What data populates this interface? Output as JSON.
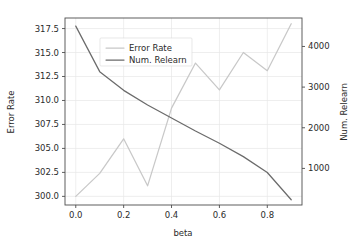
{
  "chart_data": {
    "type": "line",
    "title": "",
    "xlabel": "beta",
    "ylabel": "Error Rate",
    "y2label": "Num. Relearn",
    "grid": true,
    "legend_position": "upper-center-left",
    "x": [
      0.0,
      0.1,
      0.2,
      0.3,
      0.4,
      0.5,
      0.6,
      0.7,
      0.8,
      0.9
    ],
    "xlim": [
      -0.045,
      0.945
    ],
    "xticks": [
      0.0,
      0.2,
      0.4,
      0.6,
      0.8
    ],
    "xticklabels": [
      "0.0",
      "0.2",
      "0.4",
      "0.6",
      "0.8"
    ],
    "ylim": [
      299.1,
      318.6
    ],
    "yticks": [
      300.0,
      302.5,
      305.0,
      307.5,
      310.0,
      312.5,
      315.0,
      317.5
    ],
    "yticklabels": [
      "300.0",
      "302.5",
      "305.0",
      "307.5",
      "310.0",
      "312.5",
      "315.0",
      "317.5"
    ],
    "y2lim": [
      100,
      4700
    ],
    "y2ticks": [
      1000,
      2000,
      3000,
      4000
    ],
    "y2ticklabels": [
      "1000",
      "2000",
      "3000",
      "4000"
    ],
    "series": [
      {
        "name": "Error Rate",
        "axis": "left",
        "color": "#c8c8c8",
        "values": [
          300.0,
          302.4,
          306.0,
          301.1,
          309.2,
          313.9,
          311.1,
          315.0,
          313.1,
          318.0
        ]
      },
      {
        "name": "Num. Relearn",
        "axis": "right",
        "color": "#6b6b6b",
        "values": [
          4500,
          3380,
          2920,
          2560,
          2240,
          1920,
          1620,
          1290,
          900,
          230
        ]
      }
    ]
  },
  "legend": {
    "entries": [
      {
        "label": "Error Rate",
        "color": "#c8c8c8"
      },
      {
        "label": "Num. Relearn",
        "color": "#6b6b6b"
      }
    ]
  }
}
